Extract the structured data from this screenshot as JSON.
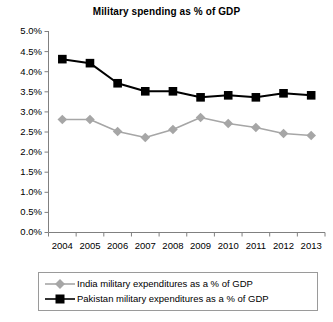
{
  "chart_data": {
    "type": "line",
    "title": "Military spending as % of GDP",
    "xlabel": "",
    "ylabel": "",
    "x": [
      2004,
      2005,
      2006,
      2007,
      2008,
      2009,
      2010,
      2011,
      2012,
      2013
    ],
    "categories": [
      "2004",
      "2005",
      "2006",
      "2007",
      "2008",
      "2009",
      "2010",
      "2011",
      "2012",
      "2013"
    ],
    "ylim": [
      0.0,
      5.0
    ],
    "yticks": [
      0.0,
      0.5,
      1.0,
      1.5,
      2.0,
      2.5,
      3.0,
      3.5,
      4.0,
      4.5,
      5.0
    ],
    "ytick_labels": [
      "0.0%",
      "0.5%",
      "1.0%",
      "1.5%",
      "2.0%",
      "2.5%",
      "3.0%",
      "3.5%",
      "4.0%",
      "4.5%",
      "5.0%"
    ],
    "grid": false,
    "legend_position": "bottom",
    "series": [
      {
        "name": "India military expenditures as a % of GDP",
        "color": "#a6a6a6",
        "marker": "diamond",
        "values": [
          2.8,
          2.8,
          2.5,
          2.35,
          2.55,
          2.85,
          2.7,
          2.6,
          2.45,
          2.4
        ]
      },
      {
        "name": "Pakistan military expenditures as a % of GDP",
        "color": "#000000",
        "marker": "square",
        "values": [
          4.3,
          4.2,
          3.7,
          3.5,
          3.5,
          3.35,
          3.4,
          3.35,
          3.45,
          3.4
        ]
      }
    ]
  },
  "legend": {
    "items": [
      {
        "label": "India military expenditures as a % of GDP"
      },
      {
        "label": "Pakistan military expenditures as a % of GDP"
      }
    ]
  }
}
